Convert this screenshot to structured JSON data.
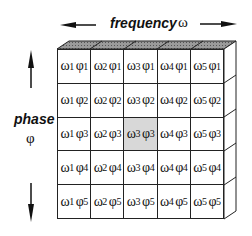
{
  "diagram": {
    "x_axis": {
      "label": "frequency",
      "symbol": "ω"
    },
    "y_axis": {
      "label": "phase",
      "symbol": "φ"
    },
    "highlighted_cell": {
      "row": 3,
      "col": 3
    },
    "colors": {
      "highlight": "#d8d8d8",
      "top_face": "#7a7a7a",
      "line": "#222222"
    },
    "rows": [
      [
        {
          "w": "ω",
          "wi": "1",
          "p": "φ",
          "pi": "1"
        },
        {
          "w": "ω",
          "wi": "2",
          "p": "φ",
          "pi": "1"
        },
        {
          "w": "ω",
          "wi": "3",
          "p": "φ",
          "pi": "1"
        },
        {
          "w": "ω",
          "wi": "4",
          "p": "φ",
          "pi": "1"
        },
        {
          "w": "ω",
          "wi": "5",
          "p": "φ",
          "pi": "1"
        }
      ],
      [
        {
          "w": "ω",
          "wi": "1",
          "p": "φ",
          "pi": "2"
        },
        {
          "w": "ω",
          "wi": "2",
          "p": "φ",
          "pi": "2"
        },
        {
          "w": "ω",
          "wi": "3",
          "p": "φ",
          "pi": "2"
        },
        {
          "w": "ω",
          "wi": "4",
          "p": "φ",
          "pi": "2"
        },
        {
          "w": "ω",
          "wi": "5",
          "p": "φ",
          "pi": "2"
        }
      ],
      [
        {
          "w": "ω",
          "wi": "1",
          "p": "φ",
          "pi": "3"
        },
        {
          "w": "ω",
          "wi": "2",
          "p": "φ",
          "pi": "3"
        },
        {
          "w": "ω",
          "wi": "3",
          "p": "φ",
          "pi": "3"
        },
        {
          "w": "ω",
          "wi": "4",
          "p": "φ",
          "pi": "3"
        },
        {
          "w": "ω",
          "wi": "5",
          "p": "φ",
          "pi": "3"
        }
      ],
      [
        {
          "w": "ω",
          "wi": "1",
          "p": "φ",
          "pi": "4"
        },
        {
          "w": "ω",
          "wi": "2",
          "p": "φ",
          "pi": "4"
        },
        {
          "w": "ω",
          "wi": "3",
          "p": "φ",
          "pi": "4"
        },
        {
          "w": "ω",
          "wi": "4",
          "p": "φ",
          "pi": "4"
        },
        {
          "w": "ω",
          "wi": "5",
          "p": "φ",
          "pi": "4"
        }
      ],
      [
        {
          "w": "ω",
          "wi": "1",
          "p": "φ",
          "pi": "5"
        },
        {
          "w": "ω",
          "wi": "2",
          "p": "φ",
          "pi": "5"
        },
        {
          "w": "ω",
          "wi": "3",
          "p": "φ",
          "pi": "5"
        },
        {
          "w": "ω",
          "wi": "4",
          "p": "φ",
          "pi": "5"
        },
        {
          "w": "ω",
          "wi": "5",
          "p": "φ",
          "pi": "5"
        }
      ]
    ]
  }
}
